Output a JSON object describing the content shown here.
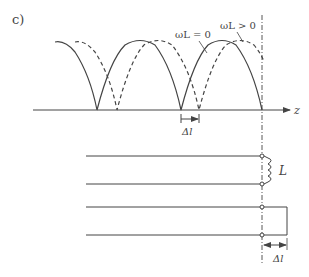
{
  "figure": {
    "panel_label": "c)",
    "curves": {
      "solid_label": "ωL = 0",
      "dashed_label": "ωL > 0"
    },
    "axis_label": "z",
    "shift_label": "Δl",
    "inductor_label": "L",
    "bottom_shift_label": "Δl"
  },
  "colors": {
    "stroke": "#444444"
  }
}
